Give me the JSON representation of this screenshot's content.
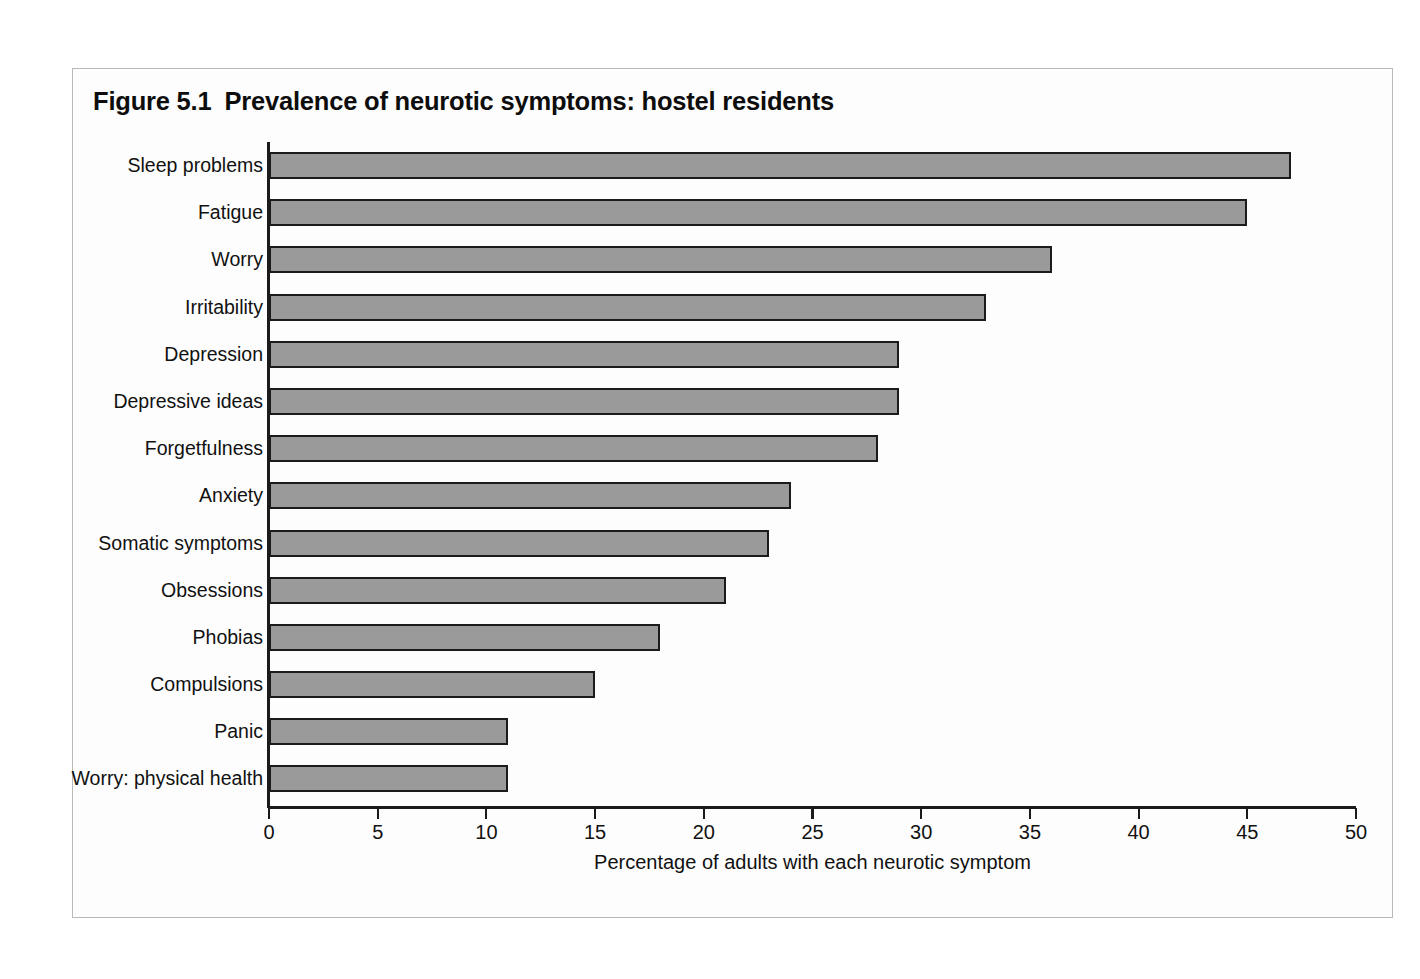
{
  "figure": {
    "number": "Figure 5.1",
    "title": "Prevalence of neurotic symptoms: hostel residents"
  },
  "chart_data": {
    "type": "bar",
    "orientation": "horizontal",
    "xlabel": "Percentage of adults with each neurotic symptom",
    "ylabel": "",
    "xlim": [
      0,
      50
    ],
    "xticks": [
      0,
      5,
      10,
      15,
      20,
      25,
      30,
      35,
      40,
      45,
      50
    ],
    "xtick_labels": [
      "0",
      "5",
      "10",
      "15",
      "20",
      "25",
      "30",
      "35",
      "40",
      "45",
      "50"
    ],
    "grid": false,
    "legend": "none",
    "bar_color": "#9a9a9a",
    "bar_edge_color": "#1b1b1b",
    "categories": [
      "Sleep problems",
      "Fatigue",
      "Worry",
      "Irritability",
      "Depression",
      "Depressive ideas",
      "Forgetfulness",
      "Anxiety",
      "Somatic symptoms",
      "Obsessions",
      "Phobias",
      "Compulsions",
      "Panic",
      "Worry: physical health"
    ],
    "values": [
      47,
      45,
      36,
      33,
      29,
      29,
      28,
      24,
      23,
      21,
      18,
      15,
      11,
      11
    ]
  }
}
